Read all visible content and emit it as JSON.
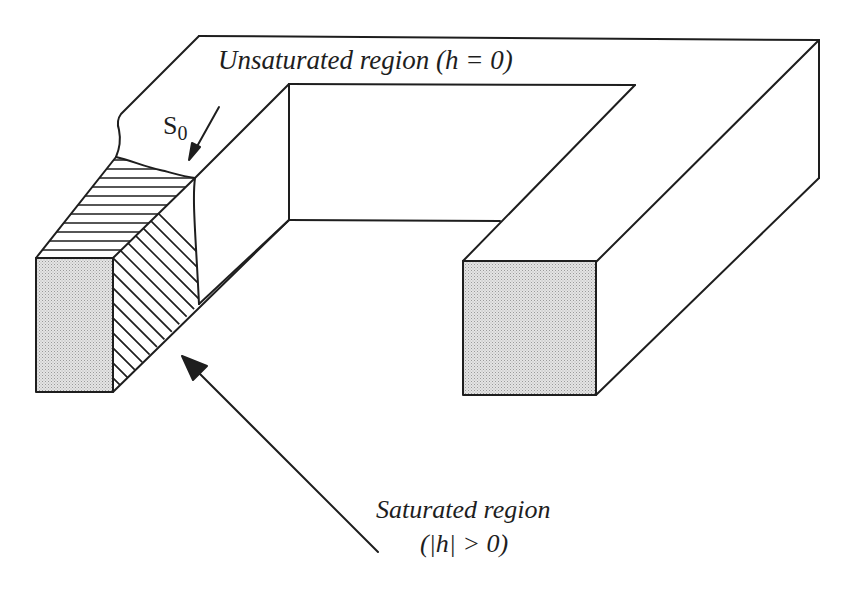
{
  "figure": {
    "type": "isometric-diagram",
    "labels": {
      "unsaturated": "Unsaturated region (h = 0)",
      "saturated": "Saturated region",
      "saturated_condition": "(|h| > 0)",
      "interface_main": "S",
      "interface_sub": "0"
    },
    "annotations": [
      {
        "id": "s0-arrow",
        "points_to": "saturation front surface S0"
      },
      {
        "id": "saturated-arrow",
        "points_to": "hatched saturated region of left leg"
      }
    ],
    "colors": {
      "line": "#1e1e1e",
      "cross_section_fill": "#d9d9d9",
      "background": "#ffffff"
    }
  }
}
